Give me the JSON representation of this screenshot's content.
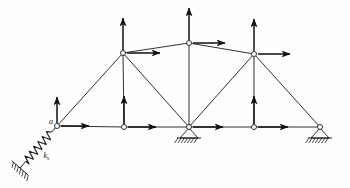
{
  "figure": {
    "kind": "truss-free-body-diagram",
    "title": "",
    "background_color": "#fdfdfb",
    "line_color": "#1a1a1a",
    "arrow_color": "#111111",
    "node_fill": "#ffffff",
    "width": 350,
    "height": 188
  },
  "labels": {
    "left_node": "a",
    "spring": "k",
    "spring_subscript": "s"
  },
  "nodes": [
    {
      "id": "a",
      "name": "left-end-node",
      "x": 57,
      "y": 126,
      "label": "a",
      "marker": "circle"
    },
    {
      "id": "b",
      "name": "bottom-left-node",
      "x": 124,
      "y": 127,
      "label": "",
      "marker": "circle"
    },
    {
      "id": "c",
      "name": "bottom-center-node",
      "x": 189,
      "y": 127,
      "label": "",
      "marker": "circle"
    },
    {
      "id": "d",
      "name": "bottom-right-node",
      "x": 254,
      "y": 127,
      "label": "",
      "marker": "circle"
    },
    {
      "id": "e",
      "name": "right-end-node",
      "x": 320,
      "y": 127,
      "label": "",
      "marker": "circle"
    },
    {
      "id": "f",
      "name": "top-left-node",
      "x": 123,
      "y": 53,
      "label": "",
      "marker": "circle"
    },
    {
      "id": "g",
      "name": "apex-node",
      "x": 189,
      "y": 43,
      "label": "",
      "marker": "circle"
    },
    {
      "id": "h",
      "name": "top-right-node",
      "x": 254,
      "y": 54,
      "label": "",
      "marker": "circle"
    }
  ],
  "members": [
    {
      "name": "bottom-chord-a-b",
      "from": "a",
      "to": "b"
    },
    {
      "name": "bottom-chord-b-c",
      "from": "b",
      "to": "c"
    },
    {
      "name": "bottom-chord-c-d",
      "from": "c",
      "to": "d"
    },
    {
      "name": "bottom-chord-d-e",
      "from": "d",
      "to": "e"
    },
    {
      "name": "top-chord-f-g",
      "from": "f",
      "to": "g"
    },
    {
      "name": "top-chord-g-h",
      "from": "g",
      "to": "h"
    },
    {
      "name": "end-post-a-f",
      "from": "a",
      "to": "f"
    },
    {
      "name": "end-post-h-e",
      "from": "h",
      "to": "e"
    },
    {
      "name": "vertical-f-b",
      "from": "f",
      "to": "b"
    },
    {
      "name": "vertical-g-c",
      "from": "g",
      "to": "c"
    },
    {
      "name": "vertical-h-d",
      "from": "h",
      "to": "d"
    },
    {
      "name": "diagonal-f-c",
      "from": "f",
      "to": "c"
    },
    {
      "name": "diagonal-h-c",
      "from": "h",
      "to": "c"
    }
  ],
  "load_arrows": [
    {
      "name": "vertical-load-left-end",
      "node": "a",
      "dir": "up",
      "x": 57,
      "y": 126,
      "length": 26
    },
    {
      "name": "horizontal-load-left-end",
      "node": "a",
      "dir": "right",
      "x": 57,
      "y": 126,
      "length": 28
    },
    {
      "name": "vertical-load-bottom-left",
      "node": "b",
      "dir": "up",
      "x": 124,
      "y": 127,
      "length": 28
    },
    {
      "name": "horizontal-load-bottom-left",
      "node": "b",
      "dir": "right",
      "x": 124,
      "y": 127,
      "length": 28
    },
    {
      "name": "horizontal-load-bottom-center",
      "node": "c",
      "dir": "right",
      "x": 189,
      "y": 127,
      "length": 30
    },
    {
      "name": "vertical-load-bottom-right",
      "node": "d",
      "dir": "up",
      "x": 254,
      "y": 127,
      "length": 28
    },
    {
      "name": "horizontal-load-bottom-right",
      "node": "d",
      "dir": "right",
      "x": 254,
      "y": 127,
      "length": 30
    },
    {
      "name": "vertical-load-top-left",
      "node": "f",
      "dir": "up",
      "x": 123,
      "y": 53,
      "length": 32
    },
    {
      "name": "horizontal-load-top-left",
      "node": "f",
      "dir": "right",
      "x": 123,
      "y": 53,
      "length": 33
    },
    {
      "name": "vertical-load-apex",
      "node": "g",
      "dir": "up",
      "x": 189,
      "y": 43,
      "length": 32
    },
    {
      "name": "horizontal-load-apex",
      "node": "g",
      "dir": "right",
      "x": 189,
      "y": 43,
      "length": 32
    },
    {
      "name": "vertical-load-top-right",
      "node": "h",
      "dir": "up",
      "x": 254,
      "y": 54,
      "length": 32
    },
    {
      "name": "horizontal-load-top-right",
      "node": "h",
      "dir": "right",
      "x": 254,
      "y": 54,
      "length": 32
    }
  ],
  "supports": [
    {
      "name": "pinned-support-center",
      "type": "pin-hatched",
      "x": 189,
      "y": 127
    },
    {
      "name": "pinned-support-right",
      "type": "pin-hatched",
      "x": 320,
      "y": 127
    },
    {
      "name": "spring-support-left",
      "type": "inclined-spring",
      "x": 57,
      "y": 126,
      "anchor_x": 20,
      "anchor_y": 168,
      "label": "k",
      "label_sub": "s"
    }
  ]
}
